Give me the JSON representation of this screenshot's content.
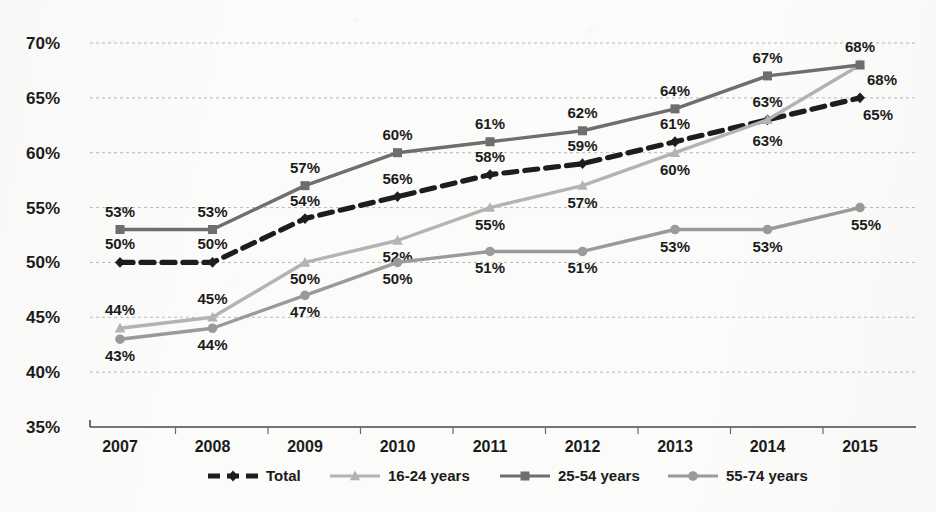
{
  "chart_data": {
    "type": "line",
    "title": "",
    "subtitle": "",
    "xlabel": "",
    "ylabel": "",
    "categories": [
      "2007",
      "2008",
      "2009",
      "2010",
      "2011",
      "2012",
      "2013",
      "2014",
      "2015"
    ],
    "ylim": [
      35,
      70
    ],
    "ytick_labels": [
      "70%",
      "65%",
      "60%",
      "55%",
      "50%",
      "45%",
      "40%",
      "35%"
    ],
    "ytick_values": [
      70,
      65,
      60,
      55,
      50,
      45,
      40,
      35
    ],
    "grid": true,
    "legend_position": "bottom",
    "value_labels": true,
    "value_label_suffix": "%",
    "series": [
      {
        "name": "Total",
        "values": [
          50,
          50,
          54,
          56,
          58,
          59,
          61,
          63,
          65
        ],
        "labels": [
          "50%",
          "50%",
          "54%",
          "56%",
          "58%",
          "59%",
          "61%",
          "63%",
          "65%"
        ],
        "color": "#1d1d1d",
        "style": "dashed",
        "marker": "diamond"
      },
      {
        "name": "16-24 years",
        "values": [
          44,
          45,
          50,
          52,
          55,
          57,
          60,
          63,
          68
        ],
        "labels": [
          "44%",
          "45%",
          "50%",
          "52%",
          "55%",
          "57%",
          "60%",
          "63%",
          "68%"
        ],
        "color": "#b3b3b3",
        "style": "solid",
        "marker": "triangle"
      },
      {
        "name": "25-54 years",
        "values": [
          53,
          53,
          57,
          60,
          61,
          62,
          64,
          67,
          68
        ],
        "labels": [
          "53%",
          "53%",
          "57%",
          "60%",
          "61%",
          "62%",
          "64%",
          "67%",
          "68%"
        ],
        "color": "#6e6e6e",
        "style": "solid",
        "marker": "square"
      },
      {
        "name": "55-74 years",
        "values": [
          43,
          44,
          47,
          50,
          51,
          51,
          53,
          53,
          55
        ],
        "labels": [
          "43%",
          "44%",
          "47%",
          "50%",
          "51%",
          "51%",
          "53%",
          "53%",
          "55%"
        ],
        "color": "#9a9a9a",
        "style": "solid",
        "marker": "circle"
      }
    ]
  }
}
